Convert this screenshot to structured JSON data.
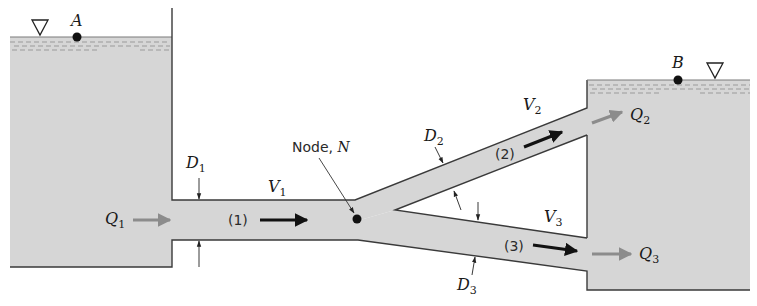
{
  "colors": {
    "water": "#d6d6d6",
    "wall": "#3a3a3a",
    "surface_dash": "#9a9a9a",
    "flow_arrow_gray": "#8c8c8c",
    "flow_arrow_black": "#111111",
    "text": "#1a1a1a"
  },
  "reservoirs": {
    "left": {
      "point_label": "A",
      "free_surface_icon": "free-surface-triangle"
    },
    "right": {
      "point_label": "B",
      "free_surface_icon": "free-surface-triangle"
    }
  },
  "node": {
    "label_prefix": "Node, ",
    "label_symbol": "N"
  },
  "pipes": [
    {
      "id": "(1)",
      "diameter_label": "D",
      "diameter_sub": "1",
      "velocity_label": "V",
      "velocity_sub": "1"
    },
    {
      "id": "(2)",
      "diameter_label": "D",
      "diameter_sub": "2",
      "velocity_label": "V",
      "velocity_sub": "2"
    },
    {
      "id": "(3)",
      "diameter_label": "D",
      "diameter_sub": "3",
      "velocity_label": "V",
      "velocity_sub": "3"
    }
  ],
  "flows": [
    {
      "label": "Q",
      "sub": "1"
    },
    {
      "label": "Q",
      "sub": "2"
    },
    {
      "label": "Q",
      "sub": "3"
    }
  ]
}
